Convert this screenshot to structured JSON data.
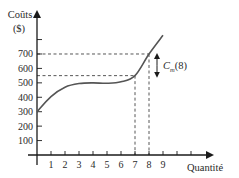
{
  "chart_data": {
    "type": "line",
    "title": "",
    "xlabel": "Quantité",
    "ylabel": "Coûts ($)",
    "ylabel_lines": [
      "Coûts",
      "($)"
    ],
    "x_ticks": [
      1,
      2,
      3,
      4,
      5,
      6,
      7,
      8,
      9,
      10,
      11
    ],
    "x_tick_labels": [
      "1",
      "2",
      "3",
      "4",
      "5",
      "6",
      "7",
      "8",
      "9",
      "",
      ""
    ],
    "y_ticks": [
      100,
      200,
      300,
      400,
      500,
      600,
      700,
      800
    ],
    "y_tick_labels": [
      "100",
      "200",
      "300",
      "400",
      "500",
      "600",
      "700",
      ""
    ],
    "xlim": [
      0,
      12
    ],
    "ylim": [
      0,
      900
    ],
    "grid": false,
    "series": [
      {
        "name": "Coût total",
        "x": [
          0,
          1,
          2,
          3,
          4,
          5,
          6,
          7,
          8,
          9
        ],
        "values": [
          300,
          405,
          470,
          495,
          500,
          497,
          507,
          550,
          700,
          830
        ]
      }
    ],
    "annotations": [
      {
        "type": "dashed-guide",
        "x": 7,
        "y": 550
      },
      {
        "type": "dashed-guide",
        "x": 8,
        "y": 700
      },
      {
        "type": "double-arrow",
        "x": 8.6,
        "from": 550,
        "to": 700,
        "label": "C",
        "label_sub": "m",
        "label_suffix": "(8)"
      }
    ]
  }
}
